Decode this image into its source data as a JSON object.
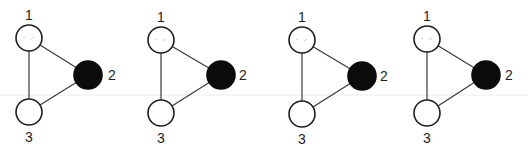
{
  "diagram": {
    "title": "",
    "panels": [
      {
        "id": "panel-1",
        "nodes": [
          {
            "id": "1",
            "label": "1",
            "state": "open"
          },
          {
            "id": "2",
            "label": "2",
            "state": "filled"
          },
          {
            "id": "3",
            "label": "3",
            "state": "open"
          }
        ],
        "edges": [
          [
            "1",
            "2"
          ],
          [
            "1",
            "3"
          ],
          [
            "2",
            "3"
          ]
        ]
      },
      {
        "id": "panel-2",
        "nodes": [
          {
            "id": "1",
            "label": "1",
            "state": "open"
          },
          {
            "id": "2",
            "label": "2",
            "state": "filled"
          },
          {
            "id": "3",
            "label": "3",
            "state": "open"
          }
        ],
        "edges": [
          [
            "1",
            "2"
          ],
          [
            "1",
            "3"
          ],
          [
            "2",
            "3"
          ]
        ]
      },
      {
        "id": "panel-3",
        "nodes": [
          {
            "id": "1",
            "label": "1",
            "state": "open"
          },
          {
            "id": "2",
            "label": "2",
            "state": "filled"
          },
          {
            "id": "3",
            "label": "3",
            "state": "open"
          }
        ],
        "edges": [
          [
            "1",
            "2"
          ],
          [
            "1",
            "3"
          ],
          [
            "2",
            "3"
          ]
        ]
      },
      {
        "id": "panel-4",
        "nodes": [
          {
            "id": "1",
            "label": "1",
            "state": "open"
          },
          {
            "id": "2",
            "label": "2",
            "state": "filled"
          },
          {
            "id": "3",
            "label": "3",
            "state": "open"
          }
        ],
        "edges": [
          [
            "1",
            "2"
          ],
          [
            "1",
            "3"
          ],
          [
            "2",
            "3"
          ]
        ]
      }
    ],
    "colors": {
      "filled_node": "#0b0b0b",
      "open_node_fill": "#ffffff",
      "stroke": "#1e1e1e"
    }
  }
}
